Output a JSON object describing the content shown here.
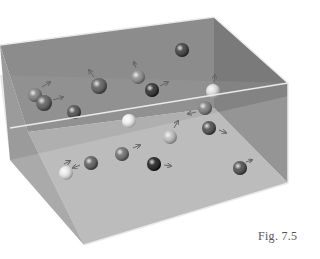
{
  "figure": {
    "caption": "Fig. 7.5",
    "colors": {
      "back_wall": "#8a8a8a",
      "floor": "#b8b8b8",
      "front_wall": "#9c9c9c",
      "right_wall": "#7a7a7a",
      "edge": "#e8e8e8"
    },
    "molecules": [
      {
        "cx": 35,
        "cy": 95,
        "r": 7,
        "shade": "#777",
        "arrow": [
          42,
          87,
          50,
          82
        ]
      },
      {
        "cx": 44,
        "cy": 103,
        "r": 8,
        "shade": "#555",
        "arrow": [
          53,
          100,
          63,
          97
        ]
      },
      {
        "cx": 99,
        "cy": 86,
        "r": 8,
        "shade": "#555",
        "arrow": [
          94,
          77,
          89,
          70
        ]
      },
      {
        "cx": 138,
        "cy": 77,
        "r": 7,
        "shade": "#888",
        "arrow": [
          136,
          68,
          134,
          62
        ]
      },
      {
        "cx": 152,
        "cy": 90,
        "r": 7,
        "shade": "#222",
        "arrow": [
          160,
          86,
          168,
          82
        ]
      },
      {
        "cx": 182,
        "cy": 50,
        "r": 7,
        "shade": "#333",
        "arrow": null
      },
      {
        "cx": 213,
        "cy": 91,
        "r": 7,
        "shade": "#ddd",
        "arrow": [
          214,
          82,
          215,
          75
        ]
      },
      {
        "cx": 74,
        "cy": 112,
        "r": 7,
        "shade": "#444",
        "arrow": null
      },
      {
        "cx": 129,
        "cy": 121,
        "r": 7,
        "shade": "#eee",
        "arrow": null
      },
      {
        "cx": 205,
        "cy": 108,
        "r": 7,
        "shade": "#777",
        "arrow": [
          196,
          112,
          188,
          114
        ]
      },
      {
        "cx": 170,
        "cy": 137,
        "r": 7,
        "shade": "#bbb",
        "arrow": [
          174,
          128,
          178,
          121
        ]
      },
      {
        "cx": 209,
        "cy": 128,
        "r": 7,
        "shade": "#444",
        "arrow": [
          219,
          130,
          226,
          133
        ]
      },
      {
        "cx": 122,
        "cy": 154,
        "r": 7,
        "shade": "#666",
        "arrow": [
          133,
          148,
          140,
          145
        ]
      },
      {
        "cx": 91,
        "cy": 163,
        "r": 7,
        "shade": "#555",
        "arrow": [
          80,
          165,
          73,
          168
        ]
      },
      {
        "cx": 66,
        "cy": 173,
        "r": 7,
        "shade": "#e6e6e6",
        "arrow": [
          64,
          164,
          70,
          161
        ]
      },
      {
        "cx": 154,
        "cy": 164,
        "r": 7,
        "shade": "#111",
        "arrow": [
          164,
          165,
          171,
          166
        ]
      },
      {
        "cx": 240,
        "cy": 168,
        "r": 7,
        "shade": "#444",
        "arrow": [
          246,
          162,
          252,
          160
        ]
      }
    ]
  }
}
